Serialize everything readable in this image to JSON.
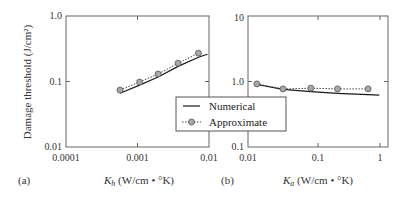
{
  "chart_data": [
    {
      "panel": "(a)",
      "type": "line",
      "title": "",
      "xlabel": "K_h (W/cm • °K)",
      "xlabel_main": "K",
      "xlabel_sub": "h",
      "xlabel_rest": " (W/cm • °K)",
      "ylabel": "Damage threshold (J/cm²)",
      "xscale": "log",
      "yscale": "log",
      "xlim": [
        0.0001,
        0.01
      ],
      "ylim": [
        0.01,
        1.0
      ],
      "x_ticks": [
        "0.0001",
        "0.001",
        "0.01"
      ],
      "y_ticks": [
        "0.01",
        "0.1",
        "1.0"
      ],
      "grid": false,
      "series": [
        {
          "name": "Numerical",
          "style": "solid",
          "x": [
            0.00057,
            0.00107,
            0.00194,
            0.0037,
            0.0071,
            0.0095
          ],
          "values": [
            0.066,
            0.088,
            0.117,
            0.17,
            0.235,
            0.26
          ]
        },
        {
          "name": "Approximate",
          "style": "dotted-circle-markers",
          "x": [
            0.00057,
            0.00107,
            0.00194,
            0.0037,
            0.0071
          ],
          "values": [
            0.074,
            0.098,
            0.13,
            0.19,
            0.27
          ]
        }
      ]
    },
    {
      "panel": "(b)",
      "type": "line",
      "title": "",
      "xlabel": "K_a (W/cm • °K)",
      "xlabel_main": "K",
      "xlabel_sub": "a",
      "xlabel_rest": " (W/cm • °K)",
      "ylabel": "",
      "xscale": "log",
      "yscale": "log",
      "xlim": [
        0.01,
        1
      ],
      "ylim": [
        0.1,
        10
      ],
      "x_ticks": [
        "0.01",
        "0.1",
        "1"
      ],
      "y_ticks": [
        "0.1",
        "1.0",
        "10"
      ],
      "grid": false,
      "series": [
        {
          "name": "Numerical",
          "style": "solid",
          "x": [
            0.0134,
            0.0316,
            0.079,
            0.19,
            0.52,
            0.75
          ],
          "values": [
            0.9,
            0.76,
            0.7,
            0.66,
            0.63,
            0.62
          ]
        },
        {
          "name": "Approximate",
          "style": "dotted-circle-markers",
          "x": [
            0.0134,
            0.0316,
            0.079,
            0.19,
            0.52
          ],
          "values": [
            0.92,
            0.77,
            0.79,
            0.77,
            0.77
          ]
        }
      ]
    }
  ],
  "legend": {
    "items": [
      {
        "label": "Numerical",
        "style": "solid"
      },
      {
        "label": "Approximate",
        "style": "dotted-circle-markers"
      }
    ]
  },
  "colors": {
    "axis": "#555555",
    "line": "#1a1a1a",
    "marker_fill": "#a8a8a8",
    "marker_stroke": "#555555"
  }
}
